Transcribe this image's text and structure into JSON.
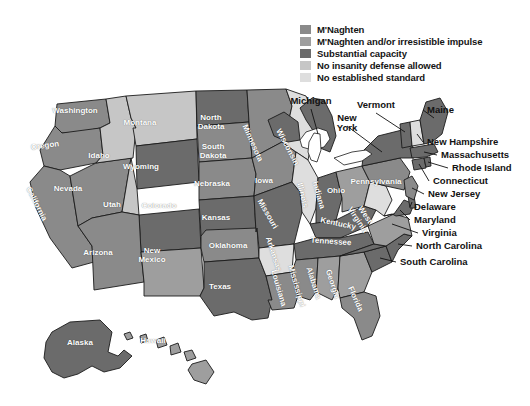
{
  "figure": {
    "type": "choropleth-map",
    "region": "United States",
    "background_color": "#ffffff",
    "outline_color": "#1b1b1b"
  },
  "legend": {
    "position": "top-right",
    "items": [
      {
        "label": "M'Naghten",
        "color": "#8a8a8a"
      },
      {
        "label": "M'Naghten and/or irresistible impulse",
        "color": "#9e9e9e"
      },
      {
        "label": "Substantial capacity",
        "color": "#6b6b6b"
      },
      {
        "label": "No insanity defense allowed",
        "color": "#c6c6c6"
      },
      {
        "label": "No established standard",
        "color": "#dedede"
      }
    ]
  },
  "chart_data": {
    "type": "map",
    "title": "",
    "categories": [
      "M'Naghten",
      "M'Naghten and/or irresistible impulse",
      "Substantial capacity",
      "No insanity defense allowed",
      "No established standard"
    ],
    "colors": [
      "#8a8a8a",
      "#9e9e9e",
      "#6b6b6b",
      "#c6c6c6",
      "#dedede"
    ],
    "values": {
      "Washington": "M'Naghten",
      "Oregon": "M'Naghten",
      "California": "M'Naghten",
      "Nevada": "M'Naghten",
      "Idaho": "No insanity defense allowed",
      "Montana": "No insanity defense allowed",
      "Utah": "No insanity defense allowed",
      "Wyoming": "Substantial capacity",
      "Colorado": "Substantial capacity",
      "Arizona": "M'Naghten",
      "New Mexico": "M'Naghten and/or irresistible impulse",
      "North Dakota": "Substantial capacity",
      "South Dakota": "M'Naghten",
      "Nebraska": "M'Naghten",
      "Kansas": "Substantial capacity",
      "Oklahoma": "M'Naghten",
      "Texas": "Substantial capacity",
      "Minnesota": "M'Naghten",
      "Iowa": "M'Naghten",
      "Missouri": "Substantial capacity",
      "Arkansas": "No established standard",
      "Louisiana": "M'Naghten",
      "Wisconsin": "No established standard",
      "Illinois": "No established standard",
      "Michigan": "Substantial capacity",
      "Indiana": "Substantial capacity",
      "Ohio": "M'Naghten and/or irresistible impulse",
      "Kentucky": "Substantial capacity",
      "Tennessee": "Substantial capacity",
      "Mississippi": "M'Naghten",
      "Alabama": "M'Naghten and/or irresistible impulse",
      "Georgia": "M'Naghten and/or irresistible impulse",
      "Florida": "M'Naghten",
      "South Carolina": "Substantial capacity",
      "North Carolina": "Substantial capacity",
      "Virginia": "M'Naghten and/or irresistible impulse",
      "West Virginia": "No established standard",
      "Maryland": "Substantial capacity",
      "Delaware": "Substantial capacity",
      "Pennsylvania": "M'Naghten",
      "New Jersey": "M'Naghten",
      "New York": "Substantial capacity",
      "Connecticut": "Substantial capacity",
      "Rhode Island": "Substantial capacity",
      "Massachusetts": "Substantial capacity",
      "Vermont": "Substantial capacity",
      "New Hampshire": "No established standard",
      "Maine": "Substantial capacity",
      "Alaska": "Substantial capacity",
      "Hawaii": "M'Naghten and/or irresistible impulse"
    }
  },
  "map_labels": [
    {
      "name": "Washington",
      "x": 75,
      "y": 112,
      "rot": 0,
      "w": 62
    },
    {
      "name": "Oregon",
      "x": 45,
      "y": 147,
      "rot": -8,
      "w": 48
    },
    {
      "name": "California",
      "x": 36,
      "y": 205,
      "rot": 63,
      "w": 62
    },
    {
      "name": "Nevada",
      "x": 68,
      "y": 190,
      "rot": 0,
      "w": 44
    },
    {
      "name": "Idaho",
      "x": 99,
      "y": 157,
      "rot": 0,
      "w": 34
    },
    {
      "name": "Montana",
      "x": 140,
      "y": 124,
      "rot": 0,
      "w": 52
    },
    {
      "name": "Wyoming",
      "x": 141,
      "y": 168,
      "rot": 0,
      "w": 52
    },
    {
      "name": "Utah",
      "x": 112,
      "y": 206,
      "rot": 0,
      "w": 28
    },
    {
      "name": "Colorado",
      "x": 159,
      "y": 207,
      "rot": 0,
      "w": 52
    },
    {
      "name": "Arizona",
      "x": 98,
      "y": 254,
      "rot": 0,
      "w": 48
    },
    {
      "name": "New\nMexico",
      "x": 152,
      "y": 252,
      "rot": 0,
      "w": 44
    },
    {
      "name": "North\nDakota",
      "x": 211,
      "y": 119,
      "rot": 0,
      "w": 46
    },
    {
      "name": "South\nDakota",
      "x": 213,
      "y": 148,
      "rot": 0,
      "w": 46
    },
    {
      "name": "Nebraska",
      "x": 212,
      "y": 185,
      "rot": 0,
      "w": 52
    },
    {
      "name": "Kansas",
      "x": 216,
      "y": 219,
      "rot": 0,
      "w": 42
    },
    {
      "name": "Oklahoma",
      "x": 228,
      "y": 247,
      "rot": 0,
      "w": 54
    },
    {
      "name": "Texas",
      "x": 220,
      "y": 288,
      "rot": 0,
      "w": 38
    },
    {
      "name": "Minnesota",
      "x": 252,
      "y": 144,
      "rot": 66,
      "w": 56
    },
    {
      "name": "Iowa",
      "x": 264,
      "y": 182,
      "rot": 0,
      "w": 28
    },
    {
      "name": "Missouri",
      "x": 267,
      "y": 215,
      "rot": 60,
      "w": 48
    },
    {
      "name": "Arkansas",
      "x": 273,
      "y": 255,
      "rot": 72,
      "w": 48
    },
    {
      "name": "Louisiana",
      "x": 278,
      "y": 289,
      "rot": 74,
      "w": 48
    },
    {
      "name": "Wisconsin",
      "x": 287,
      "y": 148,
      "rot": 62,
      "w": 52
    },
    {
      "name": "Illinois",
      "x": 302,
      "y": 196,
      "rot": 76,
      "w": 42
    },
    {
      "name": "Mississippi",
      "x": 296,
      "y": 287,
      "rot": 74,
      "w": 54
    },
    {
      "name": "Indiana",
      "x": 318,
      "y": 196,
      "rot": 74,
      "w": 42
    },
    {
      "name": "Ohio",
      "x": 336,
      "y": 192,
      "rot": 0,
      "w": 28
    },
    {
      "name": "Kentucky",
      "x": 338,
      "y": 225,
      "rot": 12,
      "w": 48
    },
    {
      "name": "Tennessee",
      "x": 331,
      "y": 243,
      "rot": 4,
      "w": 54
    },
    {
      "name": "Alabama",
      "x": 313,
      "y": 284,
      "rot": 72,
      "w": 46
    },
    {
      "name": "Georgia",
      "x": 332,
      "y": 285,
      "rot": 72,
      "w": 44
    },
    {
      "name": "Florida",
      "x": 355,
      "y": 300,
      "rot": 66,
      "w": 40
    },
    {
      "name": "West\nVirginia",
      "x": 361,
      "y": 214,
      "rot": 56,
      "w": 38
    },
    {
      "name": "Pennsylvania",
      "x": 376,
      "y": 183,
      "rot": 0,
      "w": 62
    },
    {
      "name": "Alaska",
      "x": 80,
      "y": 344,
      "rot": 0,
      "w": 42
    },
    {
      "name": "Hawaii",
      "x": 153,
      "y": 342,
      "rot": 0,
      "w": 42
    }
  ],
  "callouts": [
    {
      "label": "Michigan",
      "x": 311,
      "y": 101,
      "align": "center",
      "w": 54
    },
    {
      "label": "Vermont",
      "x": 376,
      "y": 105,
      "align": "center",
      "w": 52
    },
    {
      "label": "New\nYork",
      "x": 347,
      "y": 118,
      "align": "center",
      "w": 34
    },
    {
      "label": "Maine",
      "x": 427,
      "y": 110,
      "align": "left",
      "w": 40
    },
    {
      "label": "New Hampshire",
      "x": 427,
      "y": 142,
      "align": "left",
      "w": 88
    },
    {
      "label": "Massachusetts",
      "x": 441,
      "y": 155,
      "align": "left",
      "w": 86
    },
    {
      "label": "Rhode Island",
      "x": 452,
      "y": 168,
      "align": "left",
      "w": 76
    },
    {
      "label": "Connecticut",
      "x": 433,
      "y": 181,
      "align": "left",
      "w": 72
    },
    {
      "label": "New Jersey",
      "x": 428,
      "y": 194,
      "align": "left",
      "w": 68
    },
    {
      "label": "Delaware",
      "x": 414,
      "y": 207,
      "align": "left",
      "w": 58
    },
    {
      "label": "Maryland",
      "x": 414,
      "y": 220,
      "align": "left",
      "w": 58
    },
    {
      "label": "Virginia",
      "x": 422,
      "y": 233,
      "align": "left",
      "w": 50
    },
    {
      "label": "North Carolina",
      "x": 416,
      "y": 246,
      "align": "left",
      "w": 86
    },
    {
      "label": "South Carolina",
      "x": 400,
      "y": 262,
      "align": "left",
      "w": 86
    }
  ]
}
